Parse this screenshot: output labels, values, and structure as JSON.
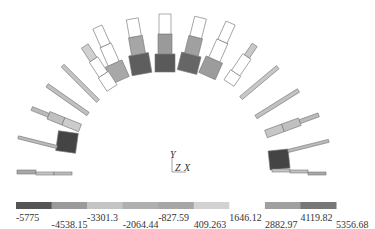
{
  "figure": {
    "type": "finite-element contour plot",
    "axes_triad": {
      "y_label": "Y",
      "z_label": "Z",
      "x_label": "X"
    }
  },
  "colorbar": {
    "orientation": "horizontal",
    "segment_colors": [
      "#555555",
      "#9a9a9a",
      "#c4c4c4",
      "#b0b0b0",
      "#a6a6a6",
      "#d2d2d2",
      "#ffffff",
      "#a0a0a0",
      "#777777"
    ],
    "tick_labels_upper": [
      "-5775",
      "-3301.3",
      "-827.59",
      "1646.12",
      "4119.82"
    ],
    "tick_labels_lower": [
      "-4538.15",
      "-2064.44",
      "409.263",
      "2882.97",
      "5356.68"
    ],
    "ticks": [
      "-5775",
      "-4538.15",
      "-3301.3",
      "-2064.44",
      "-827.59",
      "409.263",
      "1646.12",
      "2882.97",
      "4119.82",
      "5356.68"
    ]
  },
  "chart_data": {
    "type": "heatmap",
    "title": "",
    "xlabel": "X",
    "ylabel": "Y",
    "legend": {
      "position": "bottom",
      "min": -5775,
      "max": 5356.68,
      "levels": [
        -5775,
        -4538.15,
        -3301.3,
        -2064.44,
        -827.59,
        409.263,
        1646.12,
        2882.97,
        4119.82,
        5356.68
      ]
    }
  }
}
